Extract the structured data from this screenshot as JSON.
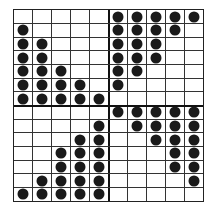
{
  "grid": {
    "columns": 10,
    "rows": 14,
    "divider_after_column": 5,
    "divider_after_row": 7,
    "line_color": "#333333",
    "dot_color": "#1a1a1a",
    "dots": [
      [
        0,
        0,
        0,
        0,
        0,
        1,
        1,
        1,
        1,
        1
      ],
      [
        1,
        0,
        0,
        0,
        0,
        1,
        1,
        1,
        1,
        0
      ],
      [
        1,
        1,
        0,
        0,
        0,
        1,
        1,
        1,
        0,
        0
      ],
      [
        1,
        1,
        0,
        0,
        0,
        1,
        1,
        1,
        0,
        0
      ],
      [
        1,
        1,
        1,
        0,
        0,
        1,
        1,
        0,
        0,
        0
      ],
      [
        1,
        1,
        1,
        1,
        0,
        1,
        0,
        0,
        0,
        0
      ],
      [
        1,
        1,
        1,
        1,
        1,
        0,
        0,
        0,
        0,
        0
      ],
      [
        0,
        0,
        0,
        0,
        0,
        1,
        1,
        1,
        1,
        1
      ],
      [
        0,
        0,
        0,
        0,
        1,
        0,
        1,
        1,
        1,
        1
      ],
      [
        0,
        0,
        0,
        1,
        1,
        0,
        0,
        1,
        1,
        1
      ],
      [
        0,
        0,
        1,
        1,
        1,
        0,
        0,
        0,
        1,
        1
      ],
      [
        0,
        0,
        1,
        1,
        1,
        0,
        0,
        0,
        1,
        1
      ],
      [
        0,
        1,
        1,
        1,
        1,
        0,
        0,
        0,
        0,
        1
      ],
      [
        1,
        1,
        1,
        1,
        1,
        0,
        0,
        0,
        0,
        0
      ]
    ]
  }
}
